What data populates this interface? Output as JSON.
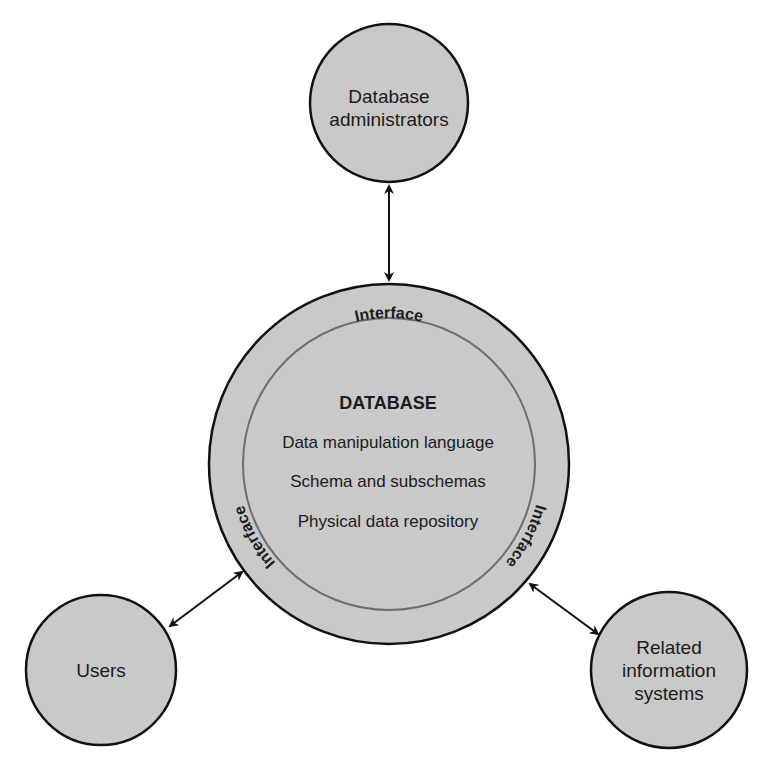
{
  "diagram": {
    "nodes": {
      "admins": {
        "line1": "Database",
        "line2": "administrators"
      },
      "users": {
        "label": "Users"
      },
      "related": {
        "line1": "Related",
        "line2": "information",
        "line3": "systems"
      }
    },
    "database": {
      "title": "DATABASE",
      "items": [
        "Data manipulation language",
        "Schema and subschemas",
        "Physical data repository"
      ]
    },
    "interface_labels": {
      "top": "Interface",
      "left": "Interface",
      "right": "Interface"
    },
    "colors": {
      "fill": "#c9c9c9",
      "stroke": "#111111",
      "inner_stroke": "#6e6e6e",
      "text": "#1c1c1c"
    }
  }
}
